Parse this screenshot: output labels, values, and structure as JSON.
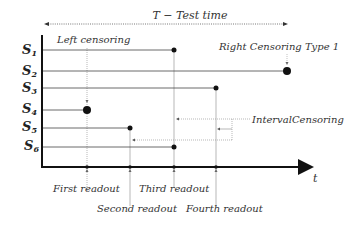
{
  "diagram": {
    "test_time_label": "T  − Test time",
    "axis_x_label": "t",
    "annotations": {
      "left_censoring": "Left censoring",
      "right_censoring": "Right Censoring Type 1",
      "interval_censoring": "IntervalCensoring"
    },
    "subjects": [
      {
        "label": "S",
        "sub": "1",
        "end_readout": "third",
        "marker": "small-dot"
      },
      {
        "label": "S",
        "sub": "2",
        "end_readout": "test-end",
        "marker": "large-dot"
      },
      {
        "label": "S",
        "sub": "3",
        "end_readout": "fourth",
        "marker": "small-dot"
      },
      {
        "label": "S",
        "sub": "4",
        "end_readout": "first",
        "marker": "large-dot"
      },
      {
        "label": "S",
        "sub": "5",
        "end_readout": "second",
        "marker": "small-dot"
      },
      {
        "label": "S",
        "sub": "6",
        "end_readout": "third",
        "marker": "small-dot"
      }
    ],
    "readouts": [
      {
        "label": "First readout"
      },
      {
        "label": "Second readout"
      },
      {
        "label": "Third readout"
      },
      {
        "label": "Fourth readout"
      }
    ],
    "colors": {
      "axis": "#1a1a1a",
      "line": "#444444",
      "guide": "#999999",
      "text": "#333333"
    }
  }
}
